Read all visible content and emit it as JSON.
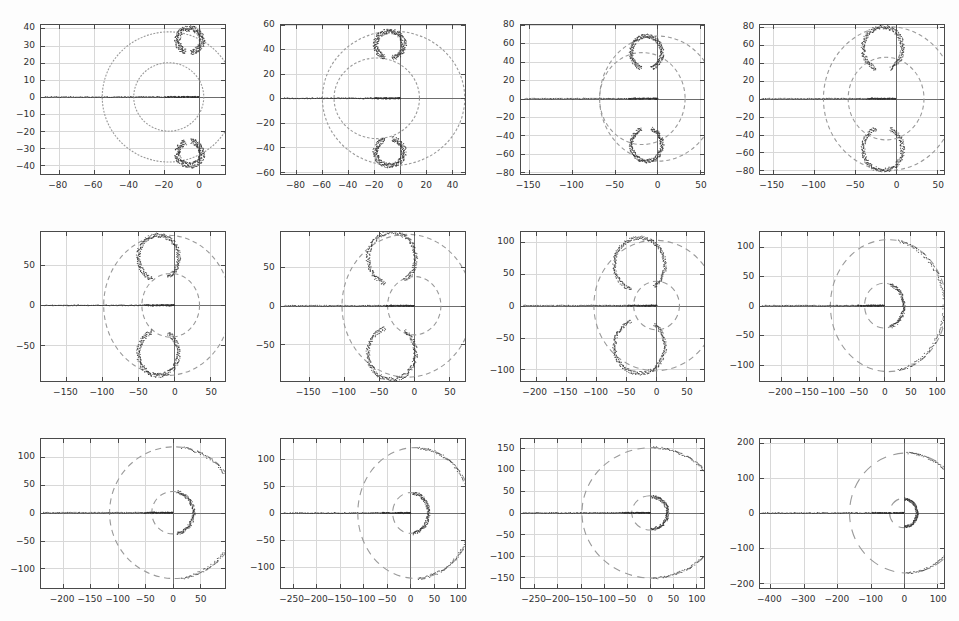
{
  "figure": {
    "title": "",
    "layout": {
      "rows": 3,
      "cols": 4
    },
    "background": "#fdfdfd",
    "marker_color": "#2e2e2e",
    "circle_color": "#9a9a9a",
    "grid_color": "#d8d8d8",
    "axis_color": "#4a4a4a"
  },
  "chart_data": {
    "type": "scatter",
    "xlabel": "",
    "ylabel": "",
    "grid": true,
    "legend": null,
    "panels": [
      {
        "id": "panel-k1",
        "title": "c_m = 0, k = 1",
        "title_prefix": "c",
        "title_sub": "m",
        "title_suffix": " = 0, k = 1",
        "k": 1,
        "cm": 0,
        "xlim": [
          -90,
          15
        ],
        "ylim": [
          -45,
          42
        ],
        "xticks": [
          -80,
          -60,
          -40,
          -20,
          0
        ],
        "yticks": [
          -40,
          -30,
          -20,
          -10,
          0,
          10,
          20,
          30,
          40
        ],
        "circles": [
          {
            "cx": -17,
            "cy": 0,
            "r": 38
          },
          {
            "cx": -17,
            "cy": 0,
            "r": 20
          }
        ],
        "real_axis_segment": [
          -88,
          0
        ],
        "arcs": [
          {
            "cx": -5,
            "cy": 33,
            "r": 7,
            "a0": -85,
            "a1": 250,
            "thick": 3.4
          },
          {
            "cx": -5,
            "cy": -33,
            "r": 7,
            "a0": 110,
            "a1": 445,
            "thick": 3.4
          }
        ]
      },
      {
        "id": "panel-k2",
        "title": "c_m = 0, k = 2",
        "title_prefix": "c",
        "title_sub": "m",
        "title_suffix": " = 0, k = 2",
        "k": 2,
        "cm": 0,
        "xlim": [
          -92,
          50
        ],
        "ylim": [
          -62,
          60
        ],
        "xticks": [
          -80,
          -60,
          -40,
          -20,
          0,
          20,
          40
        ],
        "yticks": [
          -60,
          -40,
          -20,
          0,
          20,
          40,
          60
        ],
        "circles": [
          {
            "cx": -5,
            "cy": 0,
            "r": 55
          },
          {
            "cx": -18,
            "cy": 0,
            "r": 33
          }
        ],
        "real_axis_segment": [
          -90,
          0
        ],
        "arcs": [
          {
            "cx": -8,
            "cy": 44,
            "r": 11,
            "a0": -80,
            "a1": 250,
            "thick": 4
          },
          {
            "cx": -8,
            "cy": -44,
            "r": 11,
            "a0": 110,
            "a1": 440,
            "thick": 4
          }
        ]
      },
      {
        "id": "panel-k3",
        "title": "c_m = 0, k = 3",
        "title_prefix": "c",
        "title_sub": "m",
        "title_suffix": " = 0, k = 3",
        "k": 3,
        "cm": 0,
        "xlim": [
          -160,
          55
        ],
        "ylim": [
          -82,
          80
        ],
        "xticks": [
          -150,
          -100,
          -50,
          0,
          50
        ],
        "yticks": [
          -80,
          -60,
          -40,
          -20,
          0,
          20,
          40,
          60,
          80
        ],
        "circles": [
          {
            "cx": 0,
            "cy": 0,
            "r": 68
          },
          {
            "cx": -18,
            "cy": 0,
            "r": 50
          }
        ],
        "real_axis_segment": [
          -155,
          0
        ],
        "arcs": [
          {
            "cx": -13,
            "cy": 50,
            "r": 18,
            "a0": -72,
            "a1": 250,
            "thick": 4.5
          },
          {
            "cx": -13,
            "cy": -50,
            "r": 18,
            "a0": 110,
            "a1": 432,
            "thick": 4.5
          }
        ]
      },
      {
        "id": "panel-k4",
        "title": "c_m = 0, k = 4",
        "title_prefix": "c",
        "title_sub": "m",
        "title_suffix": " = 0, k = 4",
        "k": 4,
        "cm": 0,
        "xlim": [
          -165,
          58
        ],
        "ylim": [
          -84,
          82
        ],
        "xticks": [
          -150,
          -100,
          -50,
          0,
          50
        ],
        "yticks": [
          -80,
          -60,
          -40,
          -20,
          0,
          20,
          40,
          60,
          80
        ],
        "circles": [
          {
            "cx": -8,
            "cy": 0,
            "r": 80
          },
          {
            "cx": -12,
            "cy": 0,
            "r": 46
          }
        ],
        "real_axis_segment": [
          -162,
          0
        ],
        "arcs": [
          {
            "cx": -16,
            "cy": 56,
            "r": 24,
            "a0": -68,
            "a1": 250,
            "thick": 5
          },
          {
            "cx": -16,
            "cy": -56,
            "r": 24,
            "a0": 110,
            "a1": 428,
            "thick": 5
          }
        ]
      },
      {
        "id": "panel-k5",
        "title": "c_m = 0, k = 5",
        "title_prefix": "c",
        "title_sub": "m",
        "title_suffix": " = 0, k = 5",
        "k": 5,
        "cm": 0,
        "xlim": [
          -185,
          70
        ],
        "ylim": [
          -95,
          92
        ],
        "xticks": [
          -150,
          -100,
          -50,
          0,
          50
        ],
        "yticks": [
          -50,
          0,
          50
        ],
        "circles": [
          {
            "cx": -10,
            "cy": 0,
            "r": 88
          },
          {
            "cx": -5,
            "cy": 0,
            "r": 40
          }
        ],
        "real_axis_segment": [
          -180,
          0
        ],
        "arcs": [
          {
            "cx": -22,
            "cy": 60,
            "r": 28,
            "a0": -62,
            "a1": 252,
            "thick": 5.5
          },
          {
            "cx": -22,
            "cy": -60,
            "r": 28,
            "a0": 108,
            "a1": 422,
            "thick": 5.5
          }
        ]
      },
      {
        "id": "panel-k6",
        "title": "c_m = 0, k = 6",
        "title_prefix": "c",
        "title_sub": "m",
        "title_suffix": " = 0, k = 6",
        "k": 6,
        "cm": 0,
        "xlim": [
          -190,
          72
        ],
        "ylim": [
          -98,
          96
        ],
        "xticks": [
          -150,
          -100,
          -50,
          0,
          50
        ],
        "yticks": [
          -50,
          0,
          50
        ],
        "circles": [
          {
            "cx": -10,
            "cy": 0,
            "r": 93
          },
          {
            "cx": 0,
            "cy": 0,
            "r": 38
          }
        ],
        "real_axis_segment": [
          -185,
          0
        ],
        "arcs": [
          {
            "cx": -32,
            "cy": 62,
            "r": 34,
            "a0": -58,
            "a1": 254,
            "thick": 5.5
          },
          {
            "cx": -32,
            "cy": -62,
            "r": 34,
            "a0": 106,
            "a1": 418,
            "thick": 5.5
          }
        ]
      },
      {
        "id": "panel-k7",
        "title": "c_m = 0, k = 7",
        "title_prefix": "c",
        "title_sub": "m",
        "title_suffix": " = 0, k = 7",
        "k": 7,
        "cm": 0,
        "xlim": [
          -225,
          80
        ],
        "ylim": [
          -118,
          115
        ],
        "xticks": [
          -200,
          -150,
          -100,
          -50,
          0,
          50
        ],
        "yticks": [
          -100,
          -50,
          0,
          50,
          100
        ],
        "circles": [
          {
            "cx": -2,
            "cy": 0,
            "r": 102
          },
          {
            "cx": 0,
            "cy": 0,
            "r": 38
          }
        ],
        "real_axis_segment": [
          -220,
          0
        ],
        "arcs": [
          {
            "cx": -28,
            "cy": 64,
            "r": 42,
            "a0": -55,
            "a1": 250,
            "thick": 5.5
          },
          {
            "cx": -28,
            "cy": -64,
            "r": 42,
            "a0": 110,
            "a1": 415,
            "thick": 5.5
          }
        ]
      },
      {
        "id": "panel-k8",
        "title": "c_m = 0, k = 8",
        "title_prefix": "c",
        "title_sub": "m",
        "title_suffix": " = 0, k = 8",
        "k": 8,
        "cm": 0,
        "xlim": [
          -240,
          115
        ],
        "ylim": [
          -128,
          125
        ],
        "xticks": [
          -200,
          -150,
          -100,
          -50,
          0,
          50,
          100
        ],
        "yticks": [
          -100,
          -50,
          0,
          50,
          100
        ],
        "circles": [
          {
            "cx": 8,
            "cy": 0,
            "r": 112
          },
          {
            "cx": 0,
            "cy": 0,
            "r": 38
          }
        ],
        "real_axis_segment": [
          -235,
          0
        ],
        "arcs": [
          {
            "cx": 4,
            "cy": 0,
            "r": 112,
            "a0": -78,
            "a1": 78,
            "thick": 5
          },
          {
            "cx": 0,
            "cy": 0,
            "r": 38,
            "a0": -72,
            "a1": 72,
            "thick": 6
          }
        ]
      },
      {
        "id": "panel-k9",
        "title": "c_m = 0, k = 9",
        "title_prefix": "c",
        "title_sub": "m",
        "title_suffix": " = 0, k = 9",
        "k": 9,
        "cm": 0,
        "xlim": [
          -240,
          95
        ],
        "ylim": [
          -135,
          132
        ],
        "xticks": [
          -200,
          -150,
          -100,
          -50,
          0,
          50
        ],
        "yticks": [
          -100,
          -50,
          0,
          50,
          100
        ],
        "circles": [
          {
            "cx": 3,
            "cy": 0,
            "r": 118
          },
          {
            "cx": 0,
            "cy": 0,
            "r": 38
          }
        ],
        "real_axis_segment": [
          -235,
          0
        ],
        "arcs": [
          {
            "cx": 0,
            "cy": 0,
            "r": 118,
            "a0": -82,
            "a1": 82,
            "thick": 5
          },
          {
            "cx": 0,
            "cy": 0,
            "r": 38,
            "a0": -78,
            "a1": 78,
            "thick": 6
          }
        ]
      },
      {
        "id": "panel-k10",
        "title": "c_m = 0, k = 10",
        "title_prefix": "c",
        "title_sub": "m",
        "title_suffix": " = 0, k = 10",
        "k": 10,
        "cm": 0,
        "xlim": [
          -275,
          115
        ],
        "ylim": [
          -140,
          138
        ],
        "xticks": [
          -250,
          -200,
          -150,
          -100,
          -50,
          0,
          50,
          100
        ],
        "yticks": [
          -100,
          -50,
          0,
          50,
          100
        ],
        "circles": [
          {
            "cx": 10,
            "cy": 0,
            "r": 122
          },
          {
            "cx": 0,
            "cy": 0,
            "r": 38
          }
        ],
        "real_axis_segment": [
          -270,
          0
        ],
        "arcs": [
          {
            "cx": 8,
            "cy": 0,
            "r": 122,
            "a0": -86,
            "a1": 86,
            "thick": 5
          },
          {
            "cx": 0,
            "cy": 0,
            "r": 38,
            "a0": -82,
            "a1": 82,
            "thick": 6.5
          }
        ]
      },
      {
        "id": "panel-k15",
        "title": "c_m = 0, k = 15",
        "title_prefix": "c",
        "title_sub": "m",
        "title_suffix": " = 0, k = 15",
        "k": 15,
        "cm": 0,
        "xlim": [
          -280,
          118
        ],
        "ylim": [
          -175,
          172
        ],
        "xticks": [
          -250,
          -200,
          -150,
          -100,
          -50,
          0,
          50,
          100
        ],
        "yticks": [
          -150,
          -100,
          -50,
          0,
          50,
          100,
          150
        ],
        "circles": [
          {
            "cx": 4,
            "cy": 0,
            "r": 152
          },
          {
            "cx": 0,
            "cy": 0,
            "r": 40
          }
        ],
        "real_axis_segment": [
          -275,
          0
        ],
        "arcs": [
          {
            "cx": 2,
            "cy": 0,
            "r": 152,
            "a0": -88,
            "a1": 88,
            "thick": 5
          },
          {
            "cx": 0,
            "cy": 0,
            "r": 38,
            "a0": -86,
            "a1": 86,
            "thick": 7
          }
        ]
      },
      {
        "id": "panel-k20",
        "title": "c_m = 0, k = 20",
        "title_prefix": "c",
        "title_sub": "m",
        "title_suffix": " = 0, k = 20",
        "k": 20,
        "cm": 0,
        "xlim": [
          -430,
          120
        ],
        "ylim": [
          -215,
          212
        ],
        "xticks": [
          -400,
          -300,
          -200,
          -100,
          0,
          100
        ],
        "yticks": [
          -200,
          -100,
          0,
          100,
          200
        ],
        "circles": [
          {
            "cx": 10,
            "cy": 0,
            "r": 172
          },
          {
            "cx": 0,
            "cy": 0,
            "r": 42
          }
        ],
        "real_axis_segment": [
          -425,
          0
        ],
        "arcs": [
          {
            "cx": 4,
            "cy": 0,
            "r": 172,
            "a0": -88,
            "a1": 88,
            "thick": 5
          },
          {
            "cx": 0,
            "cy": 0,
            "r": 40,
            "a0": -86,
            "a1": 86,
            "thick": 7
          }
        ]
      }
    ]
  }
}
